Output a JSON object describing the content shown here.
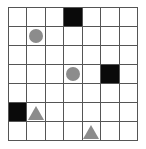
{
  "grid": {
    "rows": 7,
    "cols": 7,
    "colors": {
      "wall": "#0a0a0a",
      "piece": "#8c8c8c",
      "line": "#555555",
      "background": "#ffffff"
    },
    "walls": [
      {
        "row": 0,
        "col": 3
      },
      {
        "row": 3,
        "col": 5
      },
      {
        "row": 5,
        "col": 0
      }
    ],
    "circles": [
      {
        "row": 1,
        "col": 1
      },
      {
        "row": 3,
        "col": 3
      }
    ],
    "triangles": [
      {
        "row": 5,
        "col": 1
      },
      {
        "row": 6,
        "col": 4
      }
    ]
  }
}
